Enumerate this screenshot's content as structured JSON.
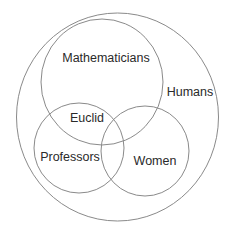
{
  "diagram": {
    "type": "venn",
    "sets": [
      {
        "id": "humans",
        "label": "Humans",
        "cx": 117.5,
        "cy": 117,
        "rx": 101,
        "ry": 104,
        "label_x": 190,
        "label_y": 96
      },
      {
        "id": "mathematicians",
        "label": "Mathematicians",
        "cx": 102,
        "cy": 82,
        "rx": 61,
        "ry": 63,
        "label_x": 106,
        "label_y": 62
      },
      {
        "id": "professors",
        "label": "Professors",
        "cx": 79,
        "cy": 148,
        "rx": 45,
        "ry": 45,
        "label_x": 70,
        "label_y": 161
      },
      {
        "id": "women",
        "label": "Women",
        "cx": 145,
        "cy": 151,
        "rx": 44,
        "ry": 45,
        "label_x": 155,
        "label_y": 165
      }
    ],
    "items": [
      {
        "id": "euclid",
        "label": "Euclid",
        "in_sets": [
          "humans",
          "mathematicians",
          "professors"
        ],
        "x": 87,
        "y": 122
      }
    ],
    "stroke_color": "#8a8a8a",
    "text_color": "#2a2a2a"
  }
}
